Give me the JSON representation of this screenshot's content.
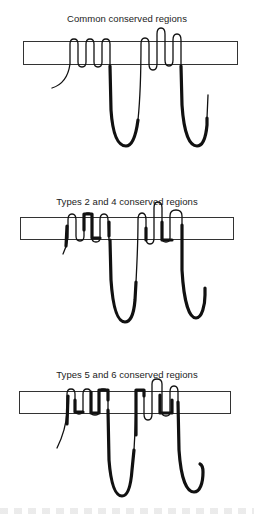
{
  "figure": {
    "panels": [
      {
        "title": "Common conserved regions"
      },
      {
        "title": "Types 2 and 4 conserved regions"
      },
      {
        "title": "Types 5 and 6 conserved regions"
      }
    ],
    "colors": {
      "line": "#111111",
      "membrane": "#333333",
      "background": "#ffffff"
    }
  }
}
